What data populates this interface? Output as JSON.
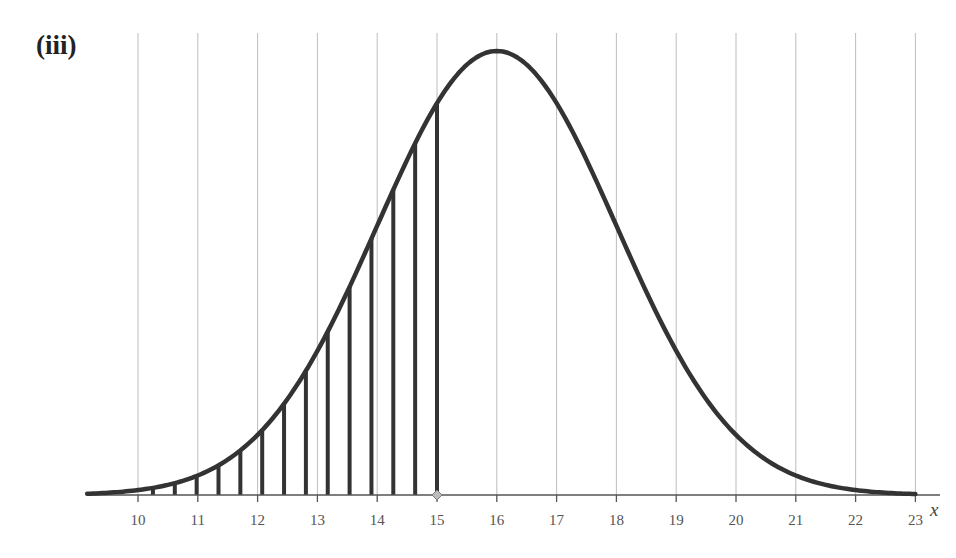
{
  "figure": {
    "label": "(iii)",
    "axis_variable": "x"
  },
  "chart_data": {
    "type": "line",
    "title": "(iii)",
    "xlabel": "x",
    "ylabel": "",
    "x_ticks": [
      10,
      11,
      12,
      13,
      14,
      15,
      16,
      17,
      18,
      19,
      20,
      21,
      22,
      23
    ],
    "xlim": [
      9.15,
      23.45
    ],
    "grid": "vertical lines at each integer tick",
    "series": [
      {
        "name": "normal curve",
        "distribution": "normal",
        "mean": 16,
        "sd": 2,
        "x_range": [
          9.15,
          23
        ]
      }
    ],
    "shaded_region": {
      "style": "vertical hatching",
      "from": 10.25,
      "to": 15,
      "line_count": 14
    },
    "marker": {
      "x": 15,
      "shape": "diamond",
      "color": "#b0b0b0"
    }
  },
  "colors": {
    "curve": "#333333",
    "grid": "#bdbdbd",
    "axis": "#555555",
    "marker_fill": "#bcbcbc"
  }
}
